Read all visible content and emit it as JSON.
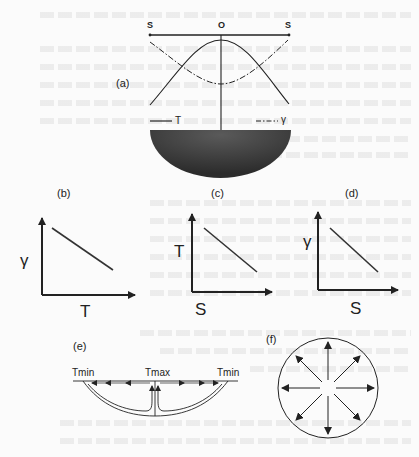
{
  "panels": {
    "a": {
      "label": "(a)",
      "axis_left": "S",
      "axis_center": "O",
      "axis_right": "S",
      "legend": [
        {
          "style": "solid",
          "symbol": "T"
        },
        {
          "style": "dash-dot",
          "symbol": "γ"
        }
      ]
    },
    "b": {
      "label": "(b)",
      "ylabel": "γ",
      "xlabel": "T"
    },
    "c": {
      "label": "(c)",
      "ylabel": "T",
      "xlabel": "S"
    },
    "d": {
      "label": "(d)",
      "ylabel": "γ",
      "xlabel": "S"
    },
    "e": {
      "label": "(e)",
      "left": "Tmin",
      "center": "Tmax",
      "right": "Tmin"
    },
    "f": {
      "label": "(f)",
      "arrows": 8
    }
  },
  "colors": {
    "ink": "#222222",
    "fill_dark": "#3a3a3a",
    "background": "#fbfbfb"
  }
}
